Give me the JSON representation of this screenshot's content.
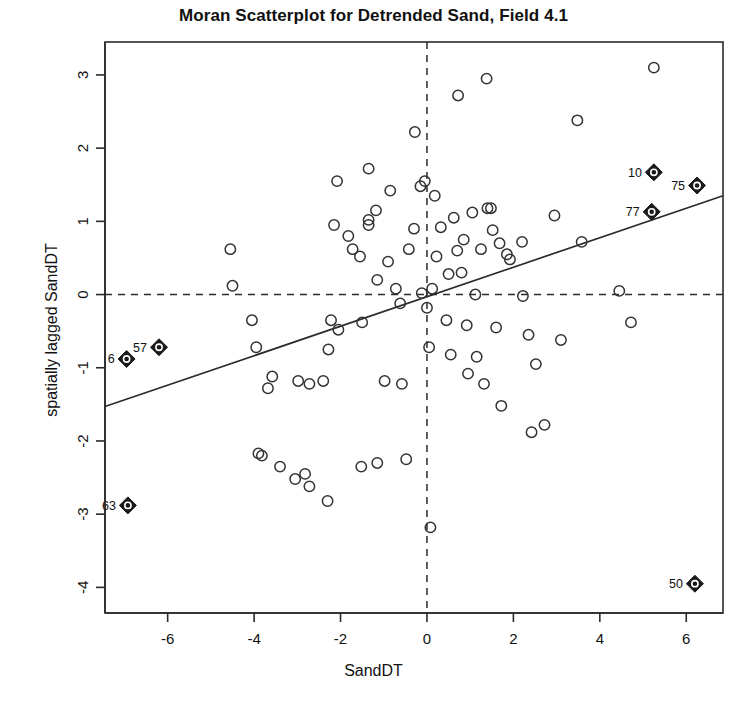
{
  "chart_data": {
    "type": "scatter",
    "title": "Moran Scatterplot for Detrended Sand, Field 4.1",
    "xlabel": "SandDT",
    "ylabel": "spatially lagged SandDT",
    "xlim": [
      -7.45,
      6.85
    ],
    "ylim": [
      -4.35,
      3.45
    ],
    "xticks": [
      -6,
      -4,
      -2,
      0,
      2,
      4,
      6
    ],
    "xtick_labels": [
      "-6",
      "-4",
      "-2",
      "0",
      "2",
      "4",
      "6"
    ],
    "yticks": [
      3,
      2,
      1,
      0,
      -1,
      -2,
      -3,
      -4
    ],
    "ytick_labels": [
      "3",
      "2",
      "1",
      "0",
      "-1",
      "-2",
      "-3",
      "-4"
    ],
    "grid": false,
    "legend": null,
    "reference_lines": [
      {
        "name": "vertical-mean-line",
        "orientation": "vertical",
        "value": 0,
        "style": "dashed"
      },
      {
        "name": "horizontal-mean-line",
        "orientation": "horizontal",
        "value": 0,
        "style": "dashed"
      }
    ],
    "regression_line": {
      "name": "moran-regression-line",
      "style": "solid",
      "slope": 0.2,
      "intercept": 0.055,
      "x_start": -7.45,
      "y_start": -1.53,
      "x_end": 6.85,
      "y_end": 1.35
    },
    "marker_styles": {
      "normal": "open-circle",
      "influential": "filled-diamond-with-circle"
    },
    "points": [
      {
        "x": -6.95,
        "y": -0.88,
        "label": "6",
        "influential": true
      },
      {
        "x": -6.2,
        "y": -0.72,
        "label": "57",
        "influential": true
      },
      {
        "x": -6.92,
        "y": -2.88,
        "label": "63",
        "influential": true
      },
      {
        "x": 5.25,
        "y": 1.67,
        "label": "10",
        "influential": true
      },
      {
        "x": 6.25,
        "y": 1.49,
        "label": "75",
        "influential": true
      },
      {
        "x": 5.2,
        "y": 1.13,
        "label": "77",
        "influential": true
      },
      {
        "x": 6.2,
        "y": -3.95,
        "label": "50",
        "influential": true
      },
      {
        "x": -4.55,
        "y": 0.62,
        "label": null,
        "influential": false
      },
      {
        "x": -4.5,
        "y": 0.12,
        "label": null,
        "influential": false
      },
      {
        "x": -4.05,
        "y": -0.35,
        "label": null,
        "influential": false
      },
      {
        "x": -3.95,
        "y": -0.72,
        "label": null,
        "influential": false
      },
      {
        "x": -3.58,
        "y": -1.12,
        "label": null,
        "influential": false
      },
      {
        "x": -3.68,
        "y": -1.28,
        "label": null,
        "influential": false
      },
      {
        "x": -3.9,
        "y": -2.17,
        "label": null,
        "influential": false
      },
      {
        "x": -3.82,
        "y": -2.2,
        "label": null,
        "influential": false
      },
      {
        "x": -3.4,
        "y": -2.35,
        "label": null,
        "influential": false
      },
      {
        "x": -3.05,
        "y": -2.52,
        "label": null,
        "influential": false
      },
      {
        "x": -2.82,
        "y": -2.45,
        "label": null,
        "influential": false
      },
      {
        "x": -2.72,
        "y": -2.62,
        "label": null,
        "influential": false
      },
      {
        "x": -2.3,
        "y": -2.82,
        "label": null,
        "influential": false
      },
      {
        "x": -2.98,
        "y": -1.18,
        "label": null,
        "influential": false
      },
      {
        "x": -2.72,
        "y": -1.22,
        "label": null,
        "influential": false
      },
      {
        "x": -2.4,
        "y": -1.18,
        "label": null,
        "influential": false
      },
      {
        "x": -2.28,
        "y": -0.75,
        "label": null,
        "influential": false
      },
      {
        "x": -2.22,
        "y": -0.35,
        "label": null,
        "influential": false
      },
      {
        "x": -2.05,
        "y": -0.48,
        "label": null,
        "influential": false
      },
      {
        "x": -2.15,
        "y": 0.95,
        "label": null,
        "influential": false
      },
      {
        "x": -2.08,
        "y": 1.55,
        "label": null,
        "influential": false
      },
      {
        "x": -1.82,
        "y": 0.8,
        "label": null,
        "influential": false
      },
      {
        "x": -1.72,
        "y": 0.62,
        "label": null,
        "influential": false
      },
      {
        "x": -1.55,
        "y": 0.52,
        "label": null,
        "influential": false
      },
      {
        "x": -1.5,
        "y": -0.38,
        "label": null,
        "influential": false
      },
      {
        "x": -1.35,
        "y": 1.72,
        "label": null,
        "influential": false
      },
      {
        "x": -1.35,
        "y": 1.02,
        "label": null,
        "influential": false
      },
      {
        "x": -1.35,
        "y": 0.95,
        "label": null,
        "influential": false
      },
      {
        "x": -1.18,
        "y": 1.15,
        "label": null,
        "influential": false
      },
      {
        "x": -1.15,
        "y": 0.2,
        "label": null,
        "influential": false
      },
      {
        "x": -1.15,
        "y": -2.3,
        "label": null,
        "influential": false
      },
      {
        "x": -1.52,
        "y": -2.35,
        "label": null,
        "influential": false
      },
      {
        "x": -0.98,
        "y": -1.18,
        "label": null,
        "influential": false
      },
      {
        "x": -0.9,
        "y": 0.45,
        "label": null,
        "influential": false
      },
      {
        "x": -0.85,
        "y": 1.42,
        "label": null,
        "influential": false
      },
      {
        "x": -0.72,
        "y": 0.08,
        "label": null,
        "influential": false
      },
      {
        "x": -0.62,
        "y": -0.12,
        "label": null,
        "influential": false
      },
      {
        "x": -0.58,
        "y": -1.22,
        "label": null,
        "influential": false
      },
      {
        "x": -0.48,
        "y": -2.25,
        "label": null,
        "influential": false
      },
      {
        "x": -0.42,
        "y": 0.62,
        "label": null,
        "influential": false
      },
      {
        "x": -0.3,
        "y": 0.9,
        "label": null,
        "influential": false
      },
      {
        "x": -0.28,
        "y": 2.22,
        "label": null,
        "influential": false
      },
      {
        "x": -0.15,
        "y": 1.48,
        "label": null,
        "influential": false
      },
      {
        "x": -0.12,
        "y": 0.02,
        "label": null,
        "influential": false
      },
      {
        "x": -0.05,
        "y": 1.55,
        "label": null,
        "influential": false
      },
      {
        "x": 0.0,
        "y": -0.18,
        "label": null,
        "influential": false
      },
      {
        "x": 0.05,
        "y": -0.72,
        "label": null,
        "influential": false
      },
      {
        "x": 0.08,
        "y": -3.18,
        "label": null,
        "influential": false
      },
      {
        "x": 0.12,
        "y": 0.08,
        "label": null,
        "influential": false
      },
      {
        "x": 0.18,
        "y": 1.35,
        "label": null,
        "influential": false
      },
      {
        "x": 0.22,
        "y": 0.52,
        "label": null,
        "influential": false
      },
      {
        "x": 0.32,
        "y": 0.92,
        "label": null,
        "influential": false
      },
      {
        "x": 0.45,
        "y": -0.35,
        "label": null,
        "influential": false
      },
      {
        "x": 0.5,
        "y": 0.28,
        "label": null,
        "influential": false
      },
      {
        "x": 0.55,
        "y": -0.82,
        "label": null,
        "influential": false
      },
      {
        "x": 0.62,
        "y": 1.05,
        "label": null,
        "influential": false
      },
      {
        "x": 0.7,
        "y": 0.6,
        "label": null,
        "influential": false
      },
      {
        "x": 0.72,
        "y": 2.72,
        "label": null,
        "influential": false
      },
      {
        "x": 0.8,
        "y": 0.3,
        "label": null,
        "influential": false
      },
      {
        "x": 0.85,
        "y": 0.75,
        "label": null,
        "influential": false
      },
      {
        "x": 0.92,
        "y": -0.42,
        "label": null,
        "influential": false
      },
      {
        "x": 0.95,
        "y": -1.08,
        "label": null,
        "influential": false
      },
      {
        "x": 1.05,
        "y": 1.12,
        "label": null,
        "influential": false
      },
      {
        "x": 1.12,
        "y": 0.0,
        "label": null,
        "influential": false
      },
      {
        "x": 1.15,
        "y": -0.85,
        "label": null,
        "influential": false
      },
      {
        "x": 1.25,
        "y": 0.62,
        "label": null,
        "influential": false
      },
      {
        "x": 1.32,
        "y": -1.22,
        "label": null,
        "influential": false
      },
      {
        "x": 1.38,
        "y": 2.95,
        "label": null,
        "influential": false
      },
      {
        "x": 1.4,
        "y": 1.18,
        "label": null,
        "influential": false
      },
      {
        "x": 1.48,
        "y": 1.18,
        "label": null,
        "influential": false
      },
      {
        "x": 1.52,
        "y": 0.88,
        "label": null,
        "influential": false
      },
      {
        "x": 1.6,
        "y": -0.45,
        "label": null,
        "influential": false
      },
      {
        "x": 1.68,
        "y": 0.7,
        "label": null,
        "influential": false
      },
      {
        "x": 1.72,
        "y": -1.52,
        "label": null,
        "influential": false
      },
      {
        "x": 1.85,
        "y": 0.55,
        "label": null,
        "influential": false
      },
      {
        "x": 1.92,
        "y": 0.48,
        "label": null,
        "influential": false
      },
      {
        "x": 2.2,
        "y": 0.72,
        "label": null,
        "influential": false
      },
      {
        "x": 2.22,
        "y": -0.02,
        "label": null,
        "influential": false
      },
      {
        "x": 2.35,
        "y": -0.55,
        "label": null,
        "influential": false
      },
      {
        "x": 2.42,
        "y": -1.88,
        "label": null,
        "influential": false
      },
      {
        "x": 2.52,
        "y": -0.95,
        "label": null,
        "influential": false
      },
      {
        "x": 2.72,
        "y": -1.78,
        "label": null,
        "influential": false
      },
      {
        "x": 2.95,
        "y": 1.08,
        "label": null,
        "influential": false
      },
      {
        "x": 3.1,
        "y": -0.62,
        "label": null,
        "influential": false
      },
      {
        "x": 3.48,
        "y": 2.38,
        "label": null,
        "influential": false
      },
      {
        "x": 3.58,
        "y": 0.72,
        "label": null,
        "influential": false
      },
      {
        "x": 4.45,
        "y": 0.05,
        "label": null,
        "influential": false
      },
      {
        "x": 4.72,
        "y": -0.38,
        "label": null,
        "influential": false
      },
      {
        "x": 5.25,
        "y": 3.1,
        "label": null,
        "influential": false
      }
    ]
  }
}
